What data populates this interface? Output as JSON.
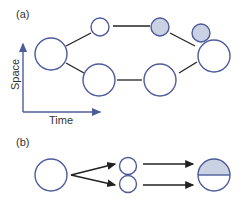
{
  "panel_a": {
    "label": "(a)",
    "y_axis_label": "Space",
    "x_axis_label": "Time",
    "nodes": [
      {
        "id": "a1",
        "shaded": false
      },
      {
        "id": "a2",
        "shaded": false
      },
      {
        "id": "a3",
        "shaded": true
      },
      {
        "id": "a4",
        "shaded": true
      },
      {
        "id": "a5",
        "shaded": false
      },
      {
        "id": "a6",
        "shaded": false
      },
      {
        "id": "a7",
        "shaded": false
      }
    ]
  },
  "panel_b": {
    "label": "(b)",
    "nodes": [
      {
        "id": "b1",
        "shaded": false
      },
      {
        "id": "b2",
        "shaded": false
      },
      {
        "id": "b3",
        "shaded": false
      },
      {
        "id": "b4",
        "shaded": "top-half"
      }
    ]
  },
  "colors": {
    "stroke": "#4e5b9c",
    "fill_shaded": "#c9d1e2",
    "edge": "#222222"
  }
}
